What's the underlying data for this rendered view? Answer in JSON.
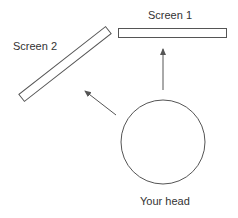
{
  "labels": {
    "screen1": "Screen 1",
    "screen2": "Screen 2",
    "head": "Your head"
  },
  "colors": {
    "stroke": "#555555",
    "text": "#333333"
  }
}
